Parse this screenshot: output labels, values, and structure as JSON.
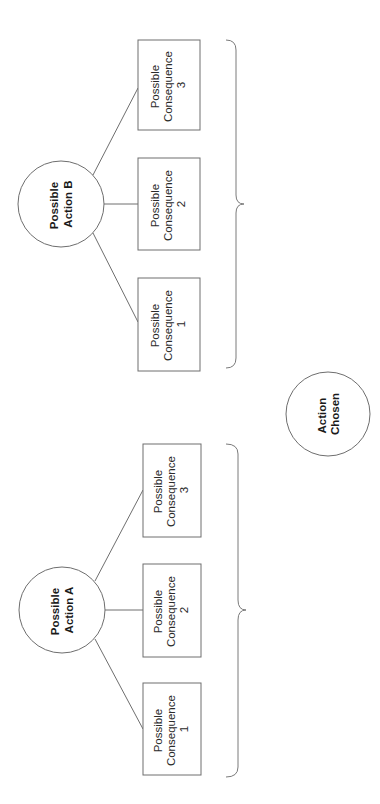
{
  "diagram": {
    "orientation": "rotated-90-ccw",
    "actions": [
      {
        "id": "A",
        "label_line1": "Possible",
        "label_line2": "Action A",
        "consequences": [
          {
            "line1": "Possible",
            "line2": "Consequence",
            "line3": "1"
          },
          {
            "line1": "Possible",
            "line2": "Consequence",
            "line3": "2"
          },
          {
            "line1": "Possible",
            "line2": "Consequence",
            "line3": "3"
          }
        ]
      },
      {
        "id": "B",
        "label_line1": "Possible",
        "label_line2": "Action B",
        "consequences": [
          {
            "line1": "Possible",
            "line2": "Consequence",
            "line3": "1"
          },
          {
            "line1": "Possible",
            "line2": "Consequence",
            "line3": "2"
          },
          {
            "line1": "Possible",
            "line2": "Consequence",
            "line3": "3"
          }
        ]
      }
    ],
    "result": {
      "label_line1": "Action",
      "label_line2": "Chosen"
    },
    "colors": {
      "stroke": "#6e6e6e",
      "text": "#1a1a1a",
      "background": "#ffffff"
    }
  }
}
